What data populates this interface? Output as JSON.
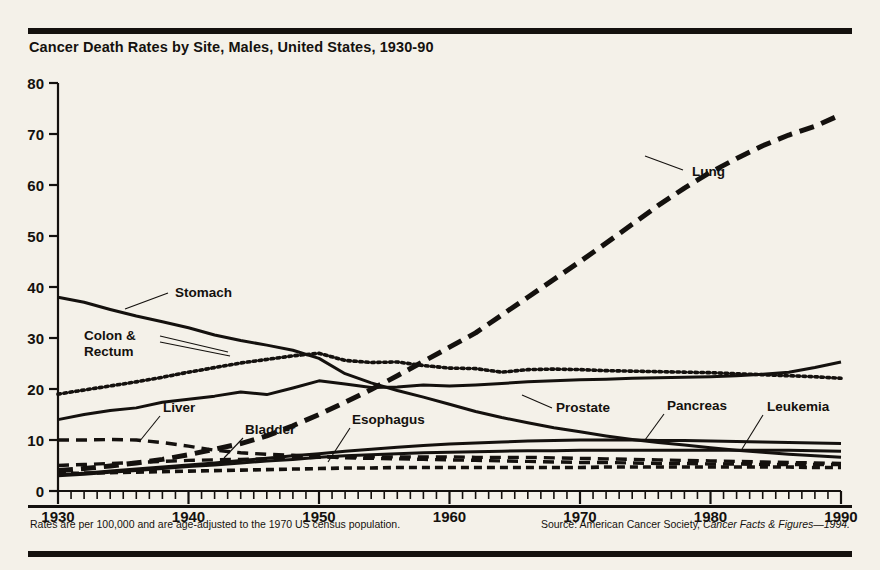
{
  "header": {
    "title": "Cancer Death Rates by Site, Males, United States, 1930-90"
  },
  "footer": {
    "left_note": "Rates are per 100,000 and are age-adjusted to the 1970 US census population.",
    "source_prefix": "Source: American Cancer Society, ",
    "source_italic": "Cancer Facts & Figures—1994."
  },
  "axes": {
    "y_ticks": [
      "0",
      "10",
      "20",
      "30",
      "40",
      "50",
      "60",
      "70",
      "80"
    ],
    "x_ticks": [
      "1930",
      "1940",
      "1950",
      "1960",
      "1970",
      "1980",
      "1990"
    ]
  },
  "labels": {
    "lung": "Lung",
    "stomach": "Stomach",
    "colon_line1": "Colon &",
    "colon_line2": "Rectum",
    "liver": "Liver",
    "bladder": "Bladder",
    "esophagus": "Esophagus",
    "prostate": "Prostate",
    "pancreas": "Pancreas",
    "leukemia": "Leukemia"
  },
  "colors": {
    "ink": "#14110e",
    "paper": "#f4f1e9"
  },
  "chart_data": {
    "type": "line",
    "title": "Cancer Death Rates by Site, Males, United States, 1930-90",
    "xlabel": "",
    "ylabel": "Rate per 100,000",
    "xlim": [
      1930,
      1990
    ],
    "ylim": [
      0,
      80
    ],
    "grid": false,
    "legend": "inline-annotations",
    "x": [
      1930,
      1932,
      1934,
      1936,
      1938,
      1940,
      1942,
      1944,
      1946,
      1948,
      1950,
      1952,
      1954,
      1956,
      1958,
      1960,
      1962,
      1964,
      1966,
      1968,
      1970,
      1972,
      1974,
      1976,
      1978,
      1980,
      1982,
      1984,
      1986,
      1988,
      1990
    ],
    "series": [
      {
        "name": "Lung",
        "style": "long-dash",
        "values": [
          4.0,
          4.4,
          4.9,
          5.5,
          6.2,
          7.1,
          8.2,
          9.3,
          10.8,
          12.8,
          15.0,
          17.4,
          19.9,
          22.6,
          25.4,
          28.2,
          31.0,
          34.5,
          38.0,
          41.5,
          45.0,
          48.6,
          52.3,
          56.0,
          59.4,
          62.5,
          65.2,
          67.7,
          69.8,
          71.5,
          73.8
        ]
      },
      {
        "name": "Stomach",
        "style": "solid",
        "values": [
          38.0,
          37.0,
          35.6,
          34.3,
          33.2,
          32.0,
          30.6,
          29.5,
          28.6,
          27.6,
          26.0,
          23.0,
          21.2,
          19.7,
          18.4,
          17.0,
          15.6,
          14.4,
          13.4,
          12.4,
          11.6,
          10.8,
          10.1,
          9.5,
          9.0,
          8.5,
          8.0,
          7.6,
          7.2,
          6.9,
          6.6
        ]
      },
      {
        "name": "Colon & Rectum",
        "style": "dotted",
        "values": [
          19.0,
          19.8,
          20.6,
          21.4,
          22.3,
          23.3,
          24.2,
          25.1,
          25.8,
          26.5,
          27.0,
          25.6,
          25.2,
          25.3,
          24.6,
          24.1,
          24.0,
          23.3,
          23.8,
          23.9,
          23.8,
          23.6,
          23.5,
          23.4,
          23.3,
          23.2,
          23.0,
          22.8,
          22.6,
          22.4,
          22.1
        ]
      },
      {
        "name": "Prostate",
        "style": "solid",
        "values": [
          14.0,
          15.0,
          15.8,
          16.3,
          17.4,
          18.0,
          18.6,
          19.4,
          18.9,
          20.2,
          21.6,
          21.0,
          20.3,
          20.4,
          20.8,
          20.6,
          20.8,
          21.1,
          21.4,
          21.6,
          21.8,
          21.9,
          22.1,
          22.2,
          22.3,
          22.4,
          22.6,
          22.9,
          23.3,
          24.2,
          25.3
        ]
      },
      {
        "name": "Liver",
        "style": "dash",
        "values": [
          10.0,
          10.0,
          10.1,
          10.0,
          9.5,
          8.8,
          8.0,
          7.5,
          7.2,
          7.0,
          6.8,
          6.5,
          6.4,
          6.3,
          6.2,
          6.1,
          6.0,
          5.9,
          5.8,
          5.7,
          5.6,
          5.6,
          5.5,
          5.4,
          5.4,
          5.3,
          5.3,
          5.2,
          5.2,
          5.2,
          5.2
        ]
      },
      {
        "name": "Pancreas",
        "style": "solid",
        "values": [
          3.2,
          3.5,
          3.9,
          4.3,
          4.7,
          5.1,
          5.5,
          6.0,
          6.4,
          6.9,
          7.3,
          7.8,
          8.2,
          8.6,
          8.9,
          9.2,
          9.4,
          9.6,
          9.8,
          9.9,
          10.0,
          10.0,
          10.0,
          9.9,
          9.9,
          9.8,
          9.7,
          9.6,
          9.5,
          9.4,
          9.3
        ]
      },
      {
        "name": "Leukemia",
        "style": "solid",
        "values": [
          3.0,
          3.3,
          3.7,
          4.0,
          4.4,
          4.8,
          5.1,
          5.5,
          5.9,
          6.2,
          6.6,
          6.9,
          7.1,
          7.3,
          7.5,
          7.6,
          7.7,
          7.8,
          7.9,
          7.9,
          8.0,
          8.0,
          8.0,
          8.0,
          8.0,
          8.0,
          8.0,
          8.0,
          8.0,
          7.9,
          7.8
        ]
      },
      {
        "name": "Bladder",
        "style": "dash",
        "values": [
          5.0,
          5.2,
          5.4,
          5.6,
          5.8,
          6.0,
          6.1,
          6.2,
          6.3,
          6.5,
          6.6,
          6.7,
          6.7,
          6.7,
          6.7,
          6.7,
          6.6,
          6.6,
          6.6,
          6.5,
          6.4,
          6.3,
          6.2,
          6.1,
          6.0,
          5.9,
          5.8,
          5.7,
          5.6,
          5.5,
          5.4
        ]
      },
      {
        "name": "Esophagus",
        "style": "short-dash",
        "values": [
          3.4,
          3.5,
          3.6,
          3.7,
          3.8,
          3.9,
          4.0,
          4.1,
          4.2,
          4.3,
          4.4,
          4.5,
          4.5,
          4.6,
          4.6,
          4.6,
          4.6,
          4.6,
          4.6,
          4.6,
          4.6,
          4.7,
          4.7,
          4.7,
          4.7,
          4.7,
          4.7,
          4.7,
          4.7,
          4.6,
          4.6
        ]
      }
    ]
  }
}
